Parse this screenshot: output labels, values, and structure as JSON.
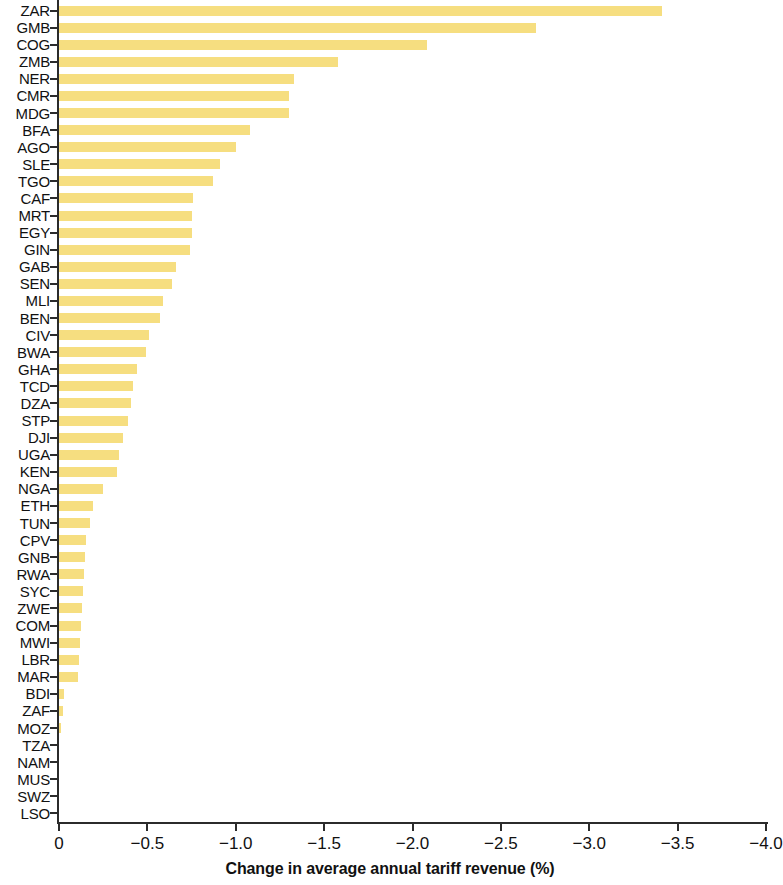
{
  "chart_data": {
    "type": "bar",
    "orientation": "horizontal",
    "title": "",
    "xlabel": "Change in average annual tariff revenue (%)",
    "ylabel": "",
    "xlim": [
      0,
      -4.0
    ],
    "xticks": [
      "0",
      "-0.5",
      "-1.0",
      "-1.5",
      "-2.0",
      "-2.5",
      "-3.0",
      "-3.5",
      "-4.0"
    ],
    "xtick_values": [
      0,
      -0.5,
      -1.0,
      -1.5,
      -2.0,
      -2.5,
      -3.0,
      -3.5,
      -4.0
    ],
    "grid": false,
    "legend": "none",
    "bar_color": "#f6de80",
    "axis_color": "#2b2b2b",
    "categories": [
      "ZAR",
      "GMB",
      "COG",
      "ZMB",
      "NER",
      "CMR",
      "MDG",
      "BFA",
      "AGO",
      "SLE",
      "TGO",
      "CAF",
      "MRT",
      "EGY",
      "GIN",
      "GAB",
      "SEN",
      "MLI",
      "BEN",
      "CIV",
      "BWA",
      "GHA",
      "TCD",
      "DZA",
      "STP",
      "DJI",
      "UGA",
      "KEN",
      "NGA",
      "ETH",
      "TUN",
      "CPV",
      "GNB",
      "RWA",
      "SYC",
      "ZWE",
      "COM",
      "MWI",
      "LBR",
      "MAR",
      "BDI",
      "ZAF",
      "MOZ",
      "TZA",
      "NAM",
      "MUS",
      "SWZ",
      "LSO"
    ],
    "values": [
      -3.41,
      -2.7,
      -2.08,
      -1.58,
      -1.33,
      -1.3,
      -1.3,
      -1.08,
      -1.0,
      -0.91,
      -0.87,
      -0.76,
      -0.75,
      -0.75,
      -0.74,
      -0.66,
      -0.64,
      -0.59,
      -0.57,
      -0.51,
      -0.49,
      -0.44,
      -0.42,
      -0.41,
      -0.39,
      -0.36,
      -0.34,
      -0.33,
      -0.25,
      -0.19,
      -0.175,
      -0.153,
      -0.145,
      -0.14,
      -0.135,
      -0.13,
      -0.125,
      -0.12,
      -0.115,
      -0.11,
      -0.03,
      -0.025,
      -0.012,
      0.0,
      0.0,
      0.0,
      0.0,
      0.0
    ]
  }
}
